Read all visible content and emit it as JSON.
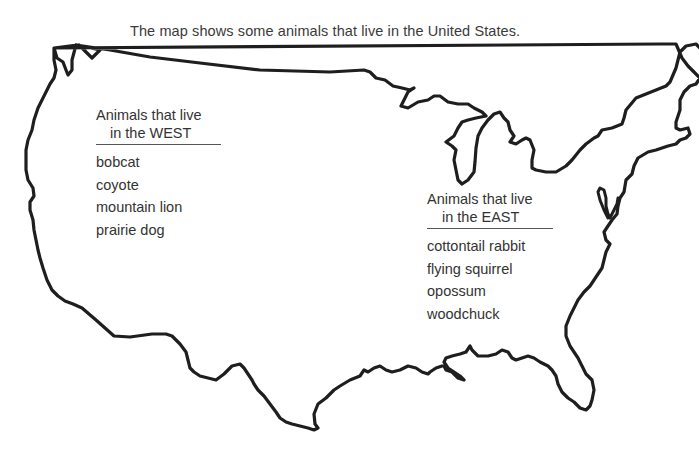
{
  "title": "The map shows some animals that live in the United States.",
  "map": {
    "subject": "United States (contiguous 48 states) outline",
    "outline_color": "#1e1e1e"
  },
  "regions": {
    "west": {
      "heading_line1": "Animals that live",
      "heading_line2": "in the WEST",
      "animals": [
        "bobcat",
        "coyote",
        "mountain lion",
        "prairie dog"
      ]
    },
    "east": {
      "heading_line1": "Animals that live",
      "heading_line2": "in the EAST",
      "animals": [
        "cottontail rabbit",
        "flying squirrel",
        "opossum",
        "woodchuck"
      ]
    }
  }
}
